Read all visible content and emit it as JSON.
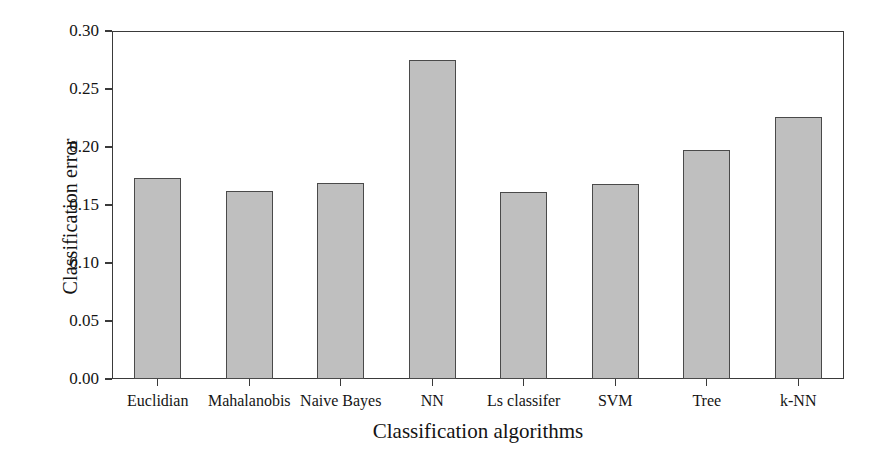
{
  "chart_data": {
    "type": "bar",
    "title": "",
    "xlabel": "Classification algorithms",
    "ylabel": "Classification error",
    "categories": [
      "Euclidian",
      "Mahalanobis",
      "Naive Bayes",
      "NN",
      "Ls classifer",
      "SVM",
      "Tree",
      "k-NN"
    ],
    "values": [
      0.173,
      0.162,
      0.169,
      0.275,
      0.161,
      0.168,
      0.197,
      0.226
    ],
    "ylim": [
      0.0,
      0.3
    ],
    "ytick_values": [
      0.0,
      0.05,
      0.1,
      0.15,
      0.2,
      0.25,
      0.3
    ],
    "ytick_labels": [
      "0.00",
      "0.05",
      "0.10",
      "0.15",
      "0.20",
      "0.25",
      "0.30"
    ],
    "grid": false,
    "legend": null,
    "bar_color": "#bfbfbf",
    "bar_edge_color": "#4a4a4a",
    "axis_color": "#3a3a3a"
  }
}
